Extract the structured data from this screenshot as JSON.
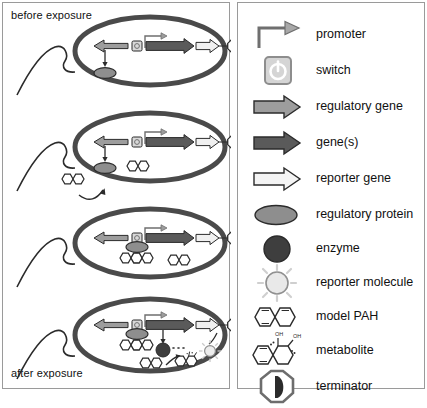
{
  "figure": {
    "panels": [
      "cells-panel",
      "legend-panel"
    ]
  },
  "cells": {
    "top_label": "before exposure",
    "bottom_label": "after exposure",
    "stages": [
      {
        "id": "stage-1",
        "name": "uninduced-cell",
        "caption": "before exposure",
        "contents": [
          "regulatory-gene",
          "switch",
          "promoter",
          "gene",
          "reporter-gene",
          "terminator",
          "regulatory-protein"
        ]
      },
      {
        "id": "stage-2",
        "name": "pah-entering-cell",
        "contents": [
          "regulatory-gene",
          "switch",
          "promoter",
          "gene",
          "reporter-gene",
          "terminator",
          "regulatory-protein",
          "model-pah"
        ]
      },
      {
        "id": "stage-3",
        "name": "protein-pah-bound-to-switch",
        "contents": [
          "regulatory-gene",
          "switch",
          "promoter",
          "gene",
          "reporter-gene",
          "terminator",
          "regulatory-protein",
          "model-pah"
        ]
      },
      {
        "id": "stage-4",
        "name": "induced-cell-expressing-enzyme-and-reporter",
        "caption": "after exposure",
        "contents": [
          "regulatory-gene",
          "switch",
          "promoter",
          "gene",
          "reporter-gene",
          "terminator",
          "regulatory-protein",
          "enzyme",
          "model-pah",
          "metabolite",
          "reporter-molecule"
        ]
      }
    ]
  },
  "legend": {
    "items": [
      {
        "icon": "promoter-icon",
        "label": "promoter"
      },
      {
        "icon": "switch-icon",
        "label": "switch"
      },
      {
        "icon": "regulatory-gene-icon",
        "label": "regulatory gene"
      },
      {
        "icon": "gene-icon",
        "label": "gene(s)"
      },
      {
        "icon": "reporter-gene-icon",
        "label": "reporter gene"
      },
      {
        "icon": "regulatory-protein-icon",
        "label": "regulatory protein"
      },
      {
        "icon": "enzyme-icon",
        "label": "enzyme"
      },
      {
        "icon": "reporter-molecule-icon",
        "label": "reporter molecule"
      },
      {
        "icon": "model-pah-icon",
        "label": "model PAH"
      },
      {
        "icon": "metabolite-icon",
        "label": "metabolite"
      },
      {
        "icon": "terminator-icon",
        "label": "terminator"
      }
    ],
    "metabolite_groups": [
      "OH",
      "OH"
    ]
  },
  "colors": {
    "frame": "#9a9a9a",
    "membrane": "#4a4a4a",
    "regulatory_gene": "#9d9d9d",
    "gene": "#5a5a5a",
    "reporter_gene": "#f0f0f0",
    "regulatory_protein": "#8e8e8e",
    "enzyme": "#3e3e3e",
    "reporter_molecule": "#e8e8e8",
    "outline": "#2b2b2b",
    "text": "#111111"
  }
}
